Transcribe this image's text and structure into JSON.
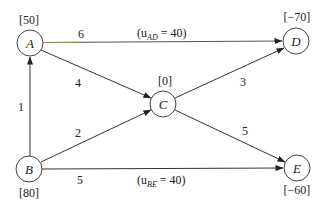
{
  "diagram": {
    "type": "network-flow",
    "nodes": [
      {
        "id": "A",
        "label": "A",
        "supply": "[50]",
        "x": 30,
        "y": 43
      },
      {
        "id": "B",
        "label": "B",
        "supply": "[80]",
        "x": 29,
        "y": 169
      },
      {
        "id": "C",
        "label": "C",
        "supply": "[0]",
        "x": 163,
        "y": 104
      },
      {
        "id": "D",
        "label": "D",
        "supply": "[−70]",
        "x": 296,
        "y": 41
      },
      {
        "id": "E",
        "label": "E",
        "supply": "[−60]",
        "x": 297,
        "y": 168
      }
    ],
    "edges": [
      {
        "from": "A",
        "to": "D",
        "cost": "6",
        "capacity": "(u_AD = 40)"
      },
      {
        "from": "A",
        "to": "C",
        "cost": "4"
      },
      {
        "from": "B",
        "to": "A",
        "cost": "1"
      },
      {
        "from": "B",
        "to": "C",
        "cost": "2"
      },
      {
        "from": "B",
        "to": "E",
        "cost": "5",
        "capacity": "(u_BE = 40)"
      },
      {
        "from": "C",
        "to": "D",
        "cost": "3"
      },
      {
        "from": "C",
        "to": "E",
        "cost": "5"
      }
    ],
    "labels": {
      "node_A": "A",
      "node_B": "B",
      "node_C": "C",
      "node_D": "D",
      "node_E": "E",
      "supply_A": "[50]",
      "supply_B": "[80]",
      "supply_C": "[0]",
      "supply_D": "[−70]",
      "supply_E": "[−60]",
      "cost_AD": "6",
      "cost_AC": "4",
      "cost_BA": "1",
      "cost_BC": "2",
      "cost_BE": "5",
      "cost_CD": "3",
      "cost_CE": "5",
      "cap_AD_open": "(u",
      "cap_AD_sub": "AD",
      "cap_AD_rest": " = 40)",
      "cap_BE_open": "(u",
      "cap_BE_sub": "BE",
      "cap_BE_rest": " = 40)"
    },
    "colors": {
      "line": "#333333",
      "node_stroke": "#444444",
      "edge_AD_accent": "#8a8a3a"
    }
  }
}
